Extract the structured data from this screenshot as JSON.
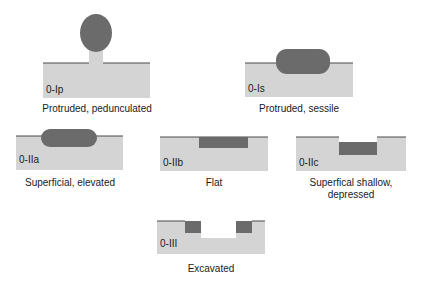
{
  "colors": {
    "tissue": "#d4d4d4",
    "lesion": "#6b6b6b",
    "surface_line": "#4a4a4a",
    "background": "#ffffff",
    "text": "#1a1a1a"
  },
  "panels": [
    {
      "code": "0-Ip",
      "caption": "Protruded, pedunculated"
    },
    {
      "code": "0-Is",
      "caption": "Protruded, sessile"
    },
    {
      "code": "0-IIa",
      "caption": "Superficial, elevated"
    },
    {
      "code": "0-IIb",
      "caption": "Flat"
    },
    {
      "code": "0-IIc",
      "caption_lines": [
        "Superfical shallow,",
        "depressed"
      ]
    },
    {
      "code": "0-III",
      "caption": "Excavated"
    }
  ]
}
